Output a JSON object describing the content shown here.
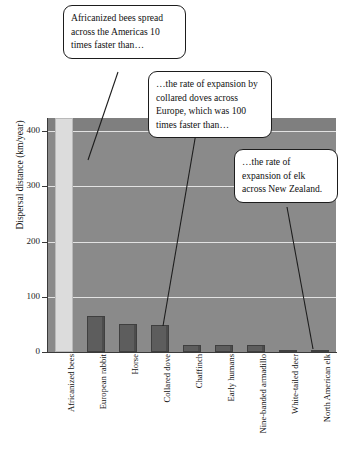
{
  "chart_data": {
    "type": "bar",
    "title": "",
    "xlabel": "",
    "ylabel": "Dispersal distance (km/year)",
    "ylim": [
      0,
      424
    ],
    "yticks": [
      0,
      100,
      200,
      300,
      400
    ],
    "ytick_labels": [
      "0",
      "100",
      "200",
      "300",
      "400"
    ],
    "grid": true,
    "legend": "none",
    "categories": [
      "Africanized bees",
      "European rabbit",
      "Horse",
      "Collared dove",
      "Chaffinch",
      "Early humans",
      "Nine-banded armadillo",
      "White-tailed deer",
      "North American elk"
    ],
    "values": [
      424,
      65,
      50,
      48,
      12,
      12,
      12,
      2,
      2
    ],
    "bar_colors": [
      "#dcdcdc",
      "#5d5d5d",
      "#5d5d5d",
      "#5d5d5d",
      "#5d5d5d",
      "#5d5d5d",
      "#5d5d5d",
      "#5d5d5d",
      "#5d5d5d"
    ],
    "plot_background": "#8a8a8a",
    "gridline_color": "#e2e2e2",
    "annotations": [
      {
        "id": "callout-bees",
        "text": "Africanized bees spread across the Americas 10 times faster than…",
        "points_to": "Africanized bees"
      },
      {
        "id": "callout-collared-dove",
        "text": "…the rate of expansion by collared doves across Europe, which was 100 times faster than…",
        "points_to": "Collared dove"
      },
      {
        "id": "callout-elk",
        "text": "…the rate of expansion of elk across New Zealand.",
        "points_to": "North American elk"
      }
    ]
  }
}
